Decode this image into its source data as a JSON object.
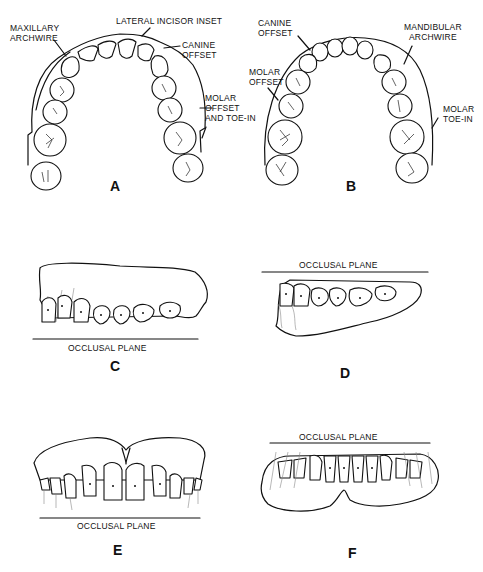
{
  "panels": {
    "A": {
      "letter": "A",
      "subject": "maxillary arch occlusal view",
      "labels": {
        "maxillary_archwire_1": "MAXILLARY",
        "maxillary_archwire_2": "ARCHWIRE",
        "lateral_incisor_inset": "LATERAL INCISOR INSET",
        "canine_offset_1": "CANINE",
        "canine_offset_2": "OFFSET",
        "molar_offset_1": "MOLAR",
        "molar_offset_2": "OFFSET",
        "molar_offset_3": "AND TOE-IN"
      }
    },
    "B": {
      "letter": "B",
      "subject": "mandibular arch occlusal view",
      "labels": {
        "canine_offset_1": "CANINE",
        "canine_offset_2": "OFFSET",
        "mandibular_archwire_1": "MANDIBULAR",
        "mandibular_archwire_2": "ARCHWIRE",
        "molar_offset_1": "MOLAR",
        "molar_offset_2": "OFFSET",
        "molar_toe_in_1": "MOLAR",
        "molar_toe_in_2": "TOE-IN"
      }
    },
    "C": {
      "letter": "C",
      "subject": "maxillary lateral view",
      "occlusal_plane": "OCCLUSAL PLANE"
    },
    "D": {
      "letter": "D",
      "subject": "mandibular lateral view",
      "occlusal_plane": "OCCLUSAL PLANE"
    },
    "E": {
      "letter": "E",
      "subject": "maxillary frontal view",
      "occlusal_plane": "OCCLUSAL PLANE"
    },
    "F": {
      "letter": "F",
      "subject": "mandibular frontal view",
      "occlusal_plane": "OCCLUSAL PLANE"
    }
  }
}
